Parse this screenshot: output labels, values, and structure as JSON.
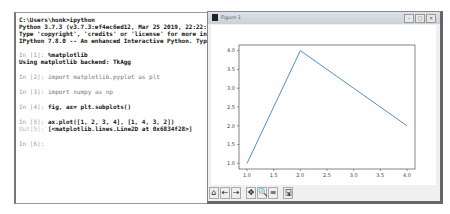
{
  "terminal": {
    "lines": [
      {
        "text": "C:\\Users\\honk>ipython",
        "style": "bold"
      },
      {
        "text": "Python 3.7.3 (v3.7.3:ef4ec6ed12, Mar 25 2019, 22:22:05)",
        "style": "bold"
      },
      {
        "text": "Type 'copyright', 'credits' or 'license' for more information",
        "style": "bold"
      },
      {
        "text": "IPython 7.8.0 -- An enhanced Interactive Python. Type '?' for help.",
        "style": "bold"
      },
      {
        "prompt": "In [1]:",
        "text": "%matplotlib"
      },
      {
        "text": "Using matplotlib backend: TkAgg",
        "style": "bold"
      },
      {
        "prompt": "In [2]:",
        "text": "import matplotlib.pyplot as plt"
      },
      {
        "prompt": "In [3]:",
        "text": "import numpy as np"
      },
      {
        "prompt": "In [4]:",
        "text": "fig, ax= plt.subplots()"
      },
      {
        "prompt": "In [5]:",
        "text": "ax.plot([1, 2, 3, 4], [1, 4, 3, 2])"
      },
      {
        "prompt": "Out[5]:",
        "text": "[<matplotlib.lines.Line2D at 0x6834f28>]"
      },
      {
        "prompt": "In [6]:",
        "text": ""
      }
    ]
  },
  "figure_window": {
    "title": "Figure 1",
    "buttons": {
      "minimize": "–",
      "maximize": "□",
      "close": "✕"
    },
    "toolbar": [
      {
        "name": "home-icon",
        "glyph": "⌂"
      },
      {
        "name": "back-icon",
        "glyph": "←"
      },
      {
        "name": "forward-icon",
        "glyph": "→"
      },
      {
        "name": "pan-icon",
        "glyph": "✥"
      },
      {
        "name": "zoom-icon",
        "glyph": "🔍"
      },
      {
        "name": "subplots-icon",
        "glyph": "≡"
      },
      {
        "name": "save-icon",
        "glyph": "🖫"
      }
    ]
  },
  "chart_data": {
    "type": "line",
    "x": [
      1,
      2,
      3,
      4
    ],
    "series": [
      {
        "name": "Line2D",
        "values": [
          1,
          4,
          3,
          2
        ],
        "color": "#1f77b4"
      }
    ],
    "xticks": [
      "1.0",
      "1.5",
      "2.0",
      "2.5",
      "3.0",
      "3.5",
      "4.0"
    ],
    "yticks": [
      "1.0",
      "1.5",
      "2.0",
      "2.5",
      "3.0",
      "3.5",
      "4.0"
    ],
    "xlim": [
      0.85,
      4.15
    ],
    "ylim": [
      0.85,
      4.15
    ],
    "title": "",
    "xlabel": "",
    "ylabel": "",
    "grid": false
  }
}
